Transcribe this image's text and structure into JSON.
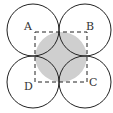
{
  "diagram": {
    "type": "geometry",
    "labels": {
      "A": "A",
      "B": "B",
      "C": "C",
      "D": "D"
    },
    "colors": {
      "stroke": "#222222",
      "shade": "#cfcfcf",
      "background": "#ffffff"
    }
  }
}
